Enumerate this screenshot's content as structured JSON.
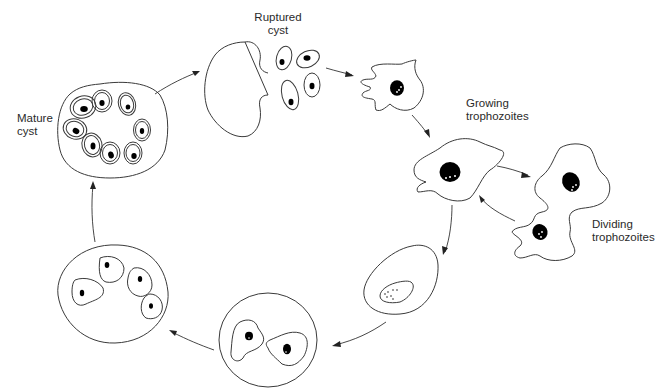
{
  "diagram": {
    "type": "life-cycle",
    "colors": {
      "line": "#3a3a3a",
      "nucleus": "#000000",
      "background": "#ffffff",
      "text": "#2a2a2a"
    },
    "labels": {
      "mature_cyst": {
        "line1": "Mature",
        "line2": "cyst"
      },
      "ruptured_cyst": {
        "line1": "Ruptured",
        "line2": "cyst"
      },
      "growing_trophozoites": {
        "line1": "Growing",
        "line2": "trophozoites"
      },
      "dividing_trophozoites": {
        "line1": "Dividing",
        "line2": "trophozoites"
      }
    },
    "stages": [
      {
        "id": "mature-cyst",
        "label": "Mature cyst",
        "nuclei": 8
      },
      {
        "id": "ruptured-cyst",
        "label": "Ruptured cyst",
        "released_cells": 4
      },
      {
        "id": "young-trophozoite",
        "label": "",
        "nuclei": 1
      },
      {
        "id": "growing-trophozoite",
        "label": "Growing trophozoites",
        "nuclei": 1
      },
      {
        "id": "dividing-trophozoites",
        "label": "Dividing trophozoites",
        "cells": 2
      },
      {
        "id": "precyst",
        "label": "",
        "nuclei": 1
      },
      {
        "id": "binucleate-cyst",
        "label": "",
        "nuclei": 2
      },
      {
        "id": "quadrinucleate-cyst",
        "label": "",
        "nuclei": 4
      }
    ],
    "arrows": [
      {
        "from": "mature-cyst",
        "to": "ruptured-cyst"
      },
      {
        "from": "ruptured-cyst",
        "to": "young-trophozoite"
      },
      {
        "from": "young-trophozoite",
        "to": "growing-trophozoite"
      },
      {
        "from": "growing-trophozoite",
        "to": "dividing-trophozoites"
      },
      {
        "from": "dividing-trophozoites",
        "to": "growing-trophozoite"
      },
      {
        "from": "growing-trophozoite",
        "to": "precyst"
      },
      {
        "from": "precyst",
        "to": "binucleate-cyst"
      },
      {
        "from": "binucleate-cyst",
        "to": "quadrinucleate-cyst"
      },
      {
        "from": "quadrinucleate-cyst",
        "to": "mature-cyst"
      }
    ]
  }
}
